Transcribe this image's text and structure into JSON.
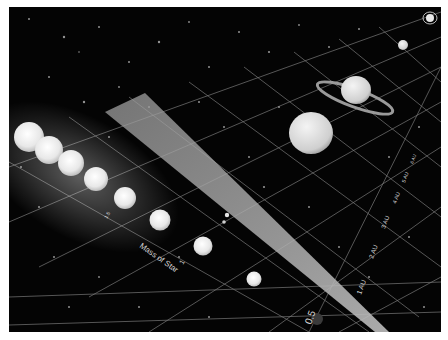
{
  "diagram": {
    "type": "habitable-zone-illustration",
    "star_mass_axis": {
      "title": "Mass of Star",
      "ticks": [
        "0.5",
        "1",
        "1.5"
      ]
    },
    "distance_axis": {
      "ticks": [
        "1 AU",
        "2 AU",
        "3 AU",
        "4 AU",
        "5 AU",
        "6 AU"
      ]
    },
    "elements": {
      "stars": 8,
      "habitable_zone_band": "translucent grey wedge",
      "planets": [
        "earth-like",
        "gas-giant",
        "ringed-giant",
        "small-planet",
        "ringed-small-planet"
      ]
    },
    "colors": {
      "background": "#040404",
      "grid": "#9a9a9a",
      "star": "#f2f2f2",
      "band": "#8c8c8c",
      "border": "#ffffff"
    }
  }
}
